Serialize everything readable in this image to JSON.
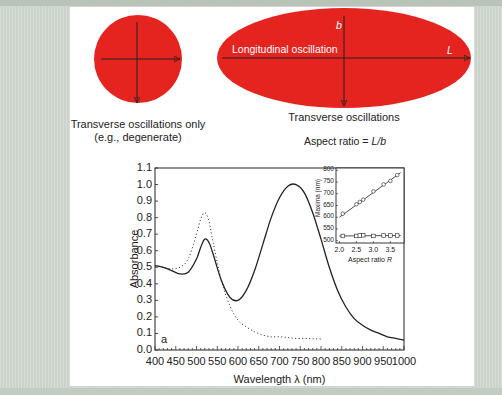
{
  "colors": {
    "particle_fill": "#e52420",
    "background": "#d2dad2",
    "panel": "#ffffff",
    "ink": "#222222"
  },
  "diagram": {
    "sphere": {
      "caption_line1": "Transverse oscillations only",
      "caption_line2": "(e.g., degenerate)"
    },
    "rod": {
      "longitudinal_label": "Longitudinal oscillation",
      "b_label": "b",
      "L_label": "L",
      "caption": "Transverse oscillations",
      "aspect_ratio_text": "Aspect ratio = ",
      "aspect_ratio_formula": "L/b"
    }
  },
  "chart_data": [
    {
      "type": "line",
      "title": "",
      "panel_label": "a",
      "xlabel": "Wavelength λ (nm)",
      "ylabel": "Absorbance",
      "xlim": [
        400,
        1000
      ],
      "ylim": [
        0.0,
        1.1
      ],
      "x_ticks": [
        "400",
        "450",
        "500",
        "550",
        "600",
        "650",
        "700",
        "750",
        "800",
        "850",
        "900",
        "950",
        "1000"
      ],
      "y_ticks": [
        "0.0",
        "0.1",
        "0.2",
        "0.3",
        "0.4",
        "0.5",
        "0.6",
        "0.7",
        "0.8",
        "0.9",
        "1.0",
        "1.1"
      ],
      "grid": false,
      "series": [
        {
          "name": "nanorods (solid)",
          "style": "solid",
          "x": [
            400,
            420,
            440,
            460,
            480,
            500,
            510,
            520,
            530,
            540,
            560,
            580,
            600,
            620,
            640,
            660,
            680,
            700,
            720,
            740,
            760,
            780,
            800,
            820,
            840,
            860,
            880,
            900,
            920,
            940,
            960,
            980,
            1000
          ],
          "y": [
            0.51,
            0.5,
            0.48,
            0.46,
            0.47,
            0.55,
            0.62,
            0.67,
            0.65,
            0.58,
            0.42,
            0.32,
            0.3,
            0.36,
            0.48,
            0.64,
            0.8,
            0.92,
            0.99,
            1.0,
            0.95,
            0.83,
            0.67,
            0.5,
            0.36,
            0.26,
            0.19,
            0.15,
            0.12,
            0.1,
            0.08,
            0.07,
            0.06
          ]
        },
        {
          "name": "nanospheres (dotted)",
          "style": "dotted",
          "x": [
            400,
            420,
            440,
            460,
            480,
            500,
            510,
            520,
            530,
            540,
            560,
            580,
            600,
            620,
            640,
            660,
            680,
            700,
            720,
            740,
            760,
            780,
            800
          ],
          "y": [
            0.51,
            0.5,
            0.49,
            0.5,
            0.55,
            0.7,
            0.79,
            0.83,
            0.78,
            0.65,
            0.42,
            0.27,
            0.18,
            0.14,
            0.11,
            0.09,
            0.08,
            0.08,
            0.075,
            0.07,
            0.07,
            0.068,
            0.067
          ]
        }
      ]
    },
    {
      "type": "scatter",
      "role": "inset",
      "xlabel": "Aspect ratio R",
      "ylabel": "Maxima (nm)",
      "xlim": [
        1.9,
        3.9
      ],
      "ylim": [
        490,
        810
      ],
      "x_ticks": [
        "2.0",
        "2.5",
        "3.0",
        "3.5"
      ],
      "y_ticks": [
        "500",
        "550",
        "600",
        "650",
        "700",
        "750",
        "800"
      ],
      "series": [
        {
          "name": "longitudinal",
          "marker": "circle",
          "x": [
            2.1,
            2.5,
            2.6,
            2.7,
            3.0,
            3.3,
            3.5,
            3.7
          ],
          "y": [
            615,
            655,
            665,
            675,
            710,
            740,
            755,
            780
          ],
          "fit_line": {
            "x": [
              2.0,
              3.8
            ],
            "y": [
              600,
              790
            ]
          }
        },
        {
          "name": "transverse",
          "marker": "square",
          "x": [
            2.1,
            2.5,
            2.6,
            2.7,
            3.0,
            3.3,
            3.5,
            3.7
          ],
          "y": [
            520,
            520,
            522,
            523,
            520,
            522,
            522,
            522
          ],
          "fit_line": {
            "x": [
              2.0,
              3.8
            ],
            "y": [
              520,
              522
            ]
          }
        }
      ]
    }
  ]
}
